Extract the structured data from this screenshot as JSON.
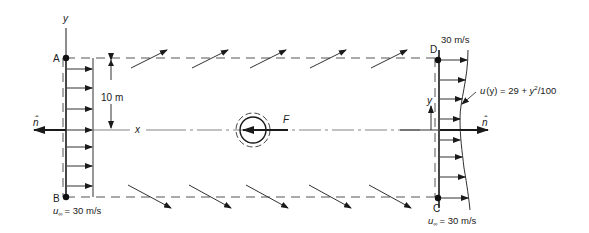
{
  "figure": {
    "points": {
      "A": "A",
      "B": "B",
      "C": "C",
      "D": "D"
    },
    "axes": {
      "x_label": "x",
      "y_label": "y",
      "y_label_right": "y"
    },
    "dimension": {
      "height_label": "10 m"
    },
    "force_label": "F",
    "normal_left": "n̂",
    "normal_right": "n̂",
    "inlet": {
      "label": "u∞ = 30 m/s",
      "u_sym": "u",
      "u_sub": "∞",
      "value": "= 30 m/s"
    },
    "outlet": {
      "top_label": "30 m/s",
      "profile_label": "u (y) = 29 + y²/100",
      "profile_prefix": "u",
      "profile_arg": "(y) = 29 + ",
      "profile_y": "y",
      "profile_sup": "2",
      "profile_tail": "/100",
      "bottom_u": "u",
      "bottom_sub": "∞",
      "bottom_value": "= 30 m/s"
    },
    "colors": {
      "line": "#1a1a1a",
      "dash": "#555555",
      "background": "#ffffff"
    }
  }
}
